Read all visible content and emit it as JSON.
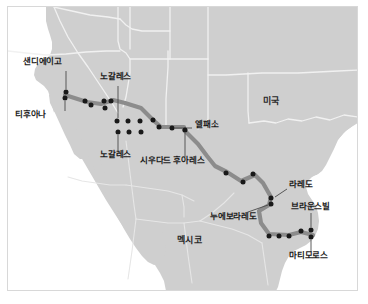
{
  "map": {
    "title": "미국-멕시코 국경 도시 지도",
    "colors": {
      "land": "#cfcfcf",
      "water": "#ffffff",
      "state_border": "#f2f2f2",
      "country_border": "#ffffff",
      "route_line": "#8c8c8c",
      "city_dot": "#1a1a1a",
      "leader_line": "#4a4a4a",
      "frame": "#d8d8d8",
      "label_text": "#1b1b1b"
    },
    "countries": [
      {
        "name": "usa",
        "label": "미국",
        "x": 262,
        "y": 101
      },
      {
        "name": "mexico",
        "label": "멕시코",
        "x": 176,
        "y": 240
      }
    ],
    "cities": [
      {
        "name": "san-diego",
        "label": "샌디에이고",
        "label_x": 22,
        "label_y": 61,
        "dot_x": 65,
        "dot_y": 91,
        "leader": [
          65,
          70,
          65,
          88
        ]
      },
      {
        "name": "tijuana",
        "label": "티후아나",
        "label_x": 14,
        "label_y": 114,
        "dot_x": 64,
        "dot_y": 97,
        "leader": [
          64,
          100,
          64,
          110
        ]
      },
      {
        "name": "nogales-us",
        "label": "노갈레스",
        "label_x": 100,
        "label_y": 76,
        "dot_x": 117,
        "dot_y": 120,
        "leader": [
          117,
          85,
          117,
          117
        ]
      },
      {
        "name": "nogales-mx",
        "label": "노갈레스",
        "label_x": 100,
        "label_y": 154,
        "dot_x": 117,
        "dot_y": 131,
        "leader": [
          117,
          134,
          117,
          150
        ]
      },
      {
        "name": "ciudad-juarez",
        "label": "시우다드 후아레스",
        "label_x": 140,
        "label_y": 160,
        "dot_x": 184,
        "dot_y": 129,
        "leader": [
          184,
          132,
          184,
          156
        ]
      },
      {
        "name": "el-paso",
        "label": "엘패소",
        "label_x": 194,
        "label_y": 124,
        "dot_x": 171,
        "dot_y": 127,
        "leader": [
          174,
          127,
          191,
          127
        ]
      },
      {
        "name": "laredo",
        "label": "라레도",
        "label_x": 288,
        "label_y": 184,
        "dot_x": 271,
        "dot_y": 197,
        "leader": [
          274,
          196,
          286,
          188
        ]
      },
      {
        "name": "nuevo-laredo",
        "label": "누에보라레도",
        "label_x": 209,
        "label_y": 216,
        "dot_x": 270,
        "dot_y": 203,
        "leader": [
          247,
          211,
          267,
          204
        ]
      },
      {
        "name": "brownsville",
        "label": "브라운스빌",
        "label_x": 290,
        "label_y": 206,
        "dot_x": 310,
        "dot_y": 229,
        "leader": [
          310,
          212,
          310,
          226
        ]
      },
      {
        "name": "matamoros",
        "label": "마티모로스",
        "label_x": 288,
        "label_y": 255,
        "dot_x": 310,
        "dot_y": 236,
        "leader": [
          310,
          239,
          310,
          251
        ]
      }
    ],
    "route_dots": [
      [
        65,
        91
      ],
      [
        64,
        97
      ],
      [
        84,
        100
      ],
      [
        90,
        104
      ],
      [
        103,
        100
      ],
      [
        104,
        107
      ],
      [
        110,
        100
      ],
      [
        116,
        120
      ],
      [
        117,
        131
      ],
      [
        127,
        120
      ],
      [
        128,
        131
      ],
      [
        139,
        120
      ],
      [
        140,
        131
      ],
      [
        152,
        119
      ],
      [
        158,
        126
      ],
      [
        171,
        127
      ],
      [
        184,
        129
      ],
      [
        225,
        172
      ],
      [
        242,
        181
      ],
      [
        252,
        173
      ],
      [
        270,
        197
      ],
      [
        270,
        203
      ],
      [
        268,
        235
      ],
      [
        278,
        235
      ],
      [
        288,
        235
      ],
      [
        300,
        230
      ],
      [
        310,
        229
      ],
      [
        310,
        236
      ]
    ],
    "route_path": "M 64,94 L 86,101 L 100,103 L 112,99 L 124,102 L 140,107 L 152,119 L 160,126 L 183,126 L 183,129 L 197,143 L 206,155 L 214,165 L 226,171 L 240,180 L 254,174 L 262,182 L 270,196 L 268,204 L 258,210 L 260,222 L 268,233 L 288,234 L 300,231 L 312,234"
  }
}
